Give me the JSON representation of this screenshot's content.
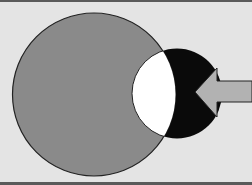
{
  "diagram": {
    "background_color": "#e4e4e4",
    "border_color": "#5a5a5a",
    "shapes": {
      "large_circle": {
        "cx": 94,
        "cy": 94.5,
        "r": 81.5,
        "fill": "#8a8a8a",
        "stroke": "#222222"
      },
      "small_circle": {
        "cx": 177,
        "cy": 93.5,
        "r": 45,
        "fill": "#0a0a0a"
      },
      "intersection": {
        "fill": "#ffffff",
        "stroke": "#222222"
      },
      "arrow": {
        "fill": "#b2b2b2",
        "stroke": "#222222",
        "direction": "left",
        "points": "195,92 217,68 217,81 252,81 252,102 217,102 217,117"
      }
    }
  }
}
